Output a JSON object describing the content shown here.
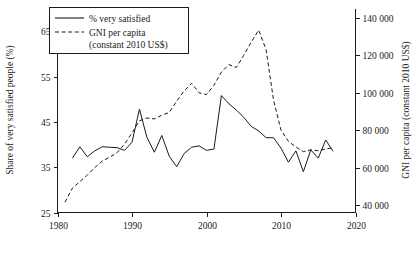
{
  "chart_data": {
    "type": "line",
    "title": "",
    "xlabel": "",
    "ylabel": "Share of very satisfied people (%)",
    "y2label": "GNI per capita (constant 2010 US$)",
    "grid": false,
    "legend_position": "top-left",
    "xlim": [
      1980,
      2020
    ],
    "ylim": [
      25,
      70
    ],
    "y2lim": [
      36000,
      145000
    ],
    "xticks": [
      "1980",
      "1990",
      "2000",
      "2010",
      "2020"
    ],
    "xtick_values": [
      1980,
      1990,
      2000,
      2010,
      2020
    ],
    "yticks": [
      "25",
      "35",
      "45",
      "55",
      "65"
    ],
    "ytick_values": [
      25,
      35,
      45,
      55,
      65
    ],
    "y2ticks": [
      "40 000",
      "60 000",
      "80 000",
      "100 000",
      "120 000",
      "140 000"
    ],
    "y2tick_values": [
      40000,
      60000,
      80000,
      100000,
      120000,
      140000
    ],
    "series": [
      {
        "name": "% very satisfied",
        "axis": "left",
        "style": "solid",
        "x": [
          1982,
          1983,
          1984,
          1985,
          1986,
          1987,
          1988,
          1989,
          1990,
          1991,
          1992,
          1993,
          1994,
          1995,
          1996,
          1997,
          1998,
          1999,
          2000,
          2001,
          2002,
          2003,
          2004,
          2005,
          2006,
          2007,
          2008,
          2009,
          2010,
          2011,
          2012,
          2013,
          2014,
          2015,
          2016,
          2017
        ],
        "values": [
          37.0,
          39.5,
          37.3,
          38.6,
          39.5,
          39.4,
          39.3,
          38.7,
          40.5,
          47.8,
          41.6,
          38.3,
          42.0,
          37.4,
          35.1,
          38.0,
          39.4,
          39.7,
          38.7,
          39.0,
          50.8,
          49.0,
          47.6,
          46.0,
          44.0,
          43.0,
          41.5,
          41.5,
          39.2,
          36.1,
          38.6,
          34.0,
          38.8,
          37.0,
          41.0,
          38.5
        ]
      },
      {
        "name": "GNI per capita (constant 2010 US$)",
        "axis": "right",
        "style": "dashed",
        "x": [
          1981,
          1982,
          1983,
          1984,
          1985,
          1986,
          1987,
          1988,
          1989,
          1990,
          1991,
          1992,
          1993,
          1994,
          1995,
          1996,
          1997,
          1998,
          1999,
          2000,
          2001,
          2002,
          2003,
          2004,
          2005,
          2006,
          2007,
          2008,
          2009,
          2010,
          2011,
          2012,
          2013,
          2014,
          2015,
          2016,
          2017
        ],
        "values": [
          41500,
          49000,
          52500,
          56000,
          60000,
          63500,
          65500,
          68000,
          72500,
          78500,
          85000,
          86500,
          86000,
          88000,
          89500,
          95500,
          101000,
          105000,
          100000,
          99000,
          104000,
          111000,
          115000,
          113500,
          120000,
          127000,
          133500,
          123000,
          96000,
          80000,
          74000,
          71000,
          68500,
          69500,
          69000,
          70000,
          70500
        ]
      }
    ]
  },
  "legend": {
    "entries": [
      {
        "label": "% very satisfied",
        "style": "solid"
      },
      {
        "label": "GNI per capita",
        "label2": "(constant 2010 US$)",
        "style": "dashed"
      }
    ]
  },
  "axes": {
    "left_title": "Share of very satisfied people (%)",
    "right_title": "GNI per capita (constant 2010 US$)"
  }
}
